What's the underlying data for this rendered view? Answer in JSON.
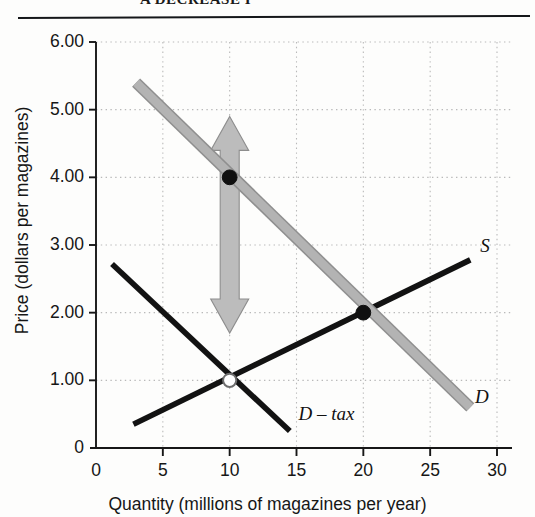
{
  "figure": {
    "caption_partial": "A  DECREASE  I",
    "background_color": "#fdfdfc"
  },
  "colors": {
    "supply_curve": "#121212",
    "demand_curve": "#b3b3b3",
    "demand_after_tax_curve": "#121212",
    "grid": "#b9b9b9",
    "axis": "#171717",
    "arrow_fill": "#bcbcbc",
    "arrow_stroke": "#8d8d8d",
    "marker_filled": "#101010",
    "marker_open_fill": "#ffffff"
  },
  "chart_data": {
    "type": "line",
    "title": "",
    "xlabel": "Quantity (millions of magazines per year)",
    "ylabel": "Price (dollars per magazines)",
    "xlim": [
      0,
      30
    ],
    "ylim": [
      0,
      6
    ],
    "xticks": [
      "0",
      "5",
      "10",
      "15",
      "20",
      "25",
      "30"
    ],
    "xtick_values": [
      0,
      5,
      10,
      15,
      20,
      25,
      30
    ],
    "yticks": [
      "0",
      "1.00",
      "2.00",
      "3.00",
      "4.00",
      "5.00",
      "6.00"
    ],
    "ytick_values": [
      0,
      1,
      2,
      3,
      4,
      5,
      6
    ],
    "grid": "dotted",
    "legend": "inline-curve-labels",
    "series": [
      {
        "name": "S",
        "label": "S",
        "style": "solid-black",
        "points": [
          [
            2.8,
            0.35
          ],
          [
            28.0,
            2.78
          ]
        ],
        "label_position": [
          28.6,
          2.95
        ]
      },
      {
        "name": "D",
        "label": "D",
        "style": "thick-gray",
        "points": [
          [
            3.0,
            5.4
          ],
          [
            28.0,
            0.6
          ]
        ],
        "label_position": [
          28.2,
          0.72
        ]
      },
      {
        "name": "D - tax",
        "label": "D – tax",
        "style": "solid-black",
        "points": [
          [
            1.2,
            2.72
          ],
          [
            14.5,
            0.25
          ]
        ],
        "label_position": [
          15.0,
          0.48
        ]
      }
    ],
    "markers": [
      {
        "name": "demand-point-high",
        "x": 10,
        "y": 4.0,
        "fill": "filled"
      },
      {
        "name": "equilibrium-before-tax",
        "x": 20,
        "y": 2.0,
        "fill": "filled"
      },
      {
        "name": "equilibrium-after-tax",
        "x": 10,
        "y": 1.0,
        "fill": "open"
      }
    ],
    "annotations": [
      {
        "name": "price-change-arrow",
        "type": "double-headed-vertical-arrow",
        "x": 10,
        "y_top": 4.9,
        "y_bottom": 1.7,
        "color": "#bcbcbc"
      }
    ]
  }
}
